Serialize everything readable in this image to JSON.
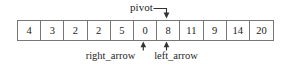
{
  "figure": {
    "background_color": "#ffffff",
    "line_color": "#777777",
    "text_color": "#1a1a1a"
  },
  "array": {
    "name": "partition-array",
    "cells": [
      {
        "value": "4"
      },
      {
        "value": "3"
      },
      {
        "value": "2"
      },
      {
        "value": "2"
      },
      {
        "value": "5"
      },
      {
        "value": "0"
      },
      {
        "value": "8"
      },
      {
        "value": "11"
      },
      {
        "value": "9"
      },
      {
        "value": "14"
      },
      {
        "value": "20"
      }
    ]
  },
  "annotations": {
    "pivot": {
      "label": "pivot",
      "target_index": 6,
      "target_value": "8",
      "connector": "elbow-down-arrow"
    },
    "right_arrow": {
      "label": "right_arrow",
      "target_index": 5,
      "target_value": "0",
      "connector": "up-arrow"
    },
    "left_arrow": {
      "label": "left_arrow",
      "target_index": 6,
      "target_value": "8",
      "connector": "up-arrow"
    }
  }
}
